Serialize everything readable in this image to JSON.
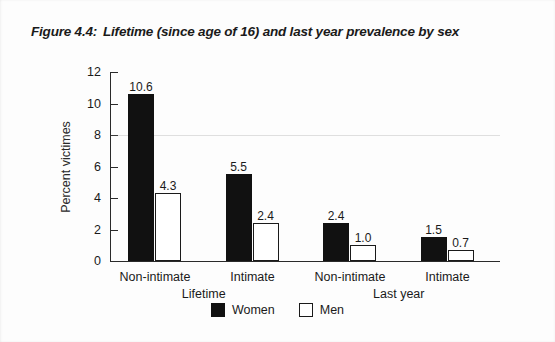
{
  "figure": {
    "number": "Figure 4.4:",
    "title": "Lifetime (since age of 16) and last year prevalence by sex"
  },
  "legend": {
    "items": [
      {
        "label": "Women",
        "swatch": "filled-black-square"
      },
      {
        "label": "Men",
        "swatch": "outlined-white-square"
      }
    ]
  },
  "chart_data": {
    "type": "bar",
    "title": "Lifetime (since age of 16) and last year prevalence by sex",
    "xlabel": "",
    "ylabel": "Percent victimes",
    "ylim": [
      0,
      12
    ],
    "yticks": [
      0,
      2,
      4,
      6,
      8,
      10,
      12
    ],
    "ytick_labels": [
      "0",
      "2",
      "4",
      "6",
      "8",
      "10",
      "12"
    ],
    "grid": false,
    "legend_position": "bottom-center",
    "categories": [
      "Non-intimate",
      "Intimate",
      "Non-intimate",
      "Intimate"
    ],
    "group_labels": [
      "Lifetime",
      "Last year"
    ],
    "groups": [
      {
        "name": "Lifetime",
        "categories": [
          "Non-intimate",
          "Intimate"
        ]
      },
      {
        "name": "Last year",
        "categories": [
          "Non-intimate",
          "Intimate"
        ]
      }
    ],
    "series": [
      {
        "name": "Women",
        "color": "#111111",
        "values": [
          10.6,
          5.5,
          2.4,
          1.5
        ]
      },
      {
        "name": "Men",
        "color": "#ffffff",
        "values": [
          4.3,
          2.4,
          1.0,
          0.7
        ]
      }
    ],
    "data_labels": {
      "Women": [
        "10.6",
        "5.5",
        "2.4",
        "1.5"
      ],
      "Men": [
        "4.3",
        "2.4",
        "1.0",
        "0.7"
      ]
    }
  }
}
